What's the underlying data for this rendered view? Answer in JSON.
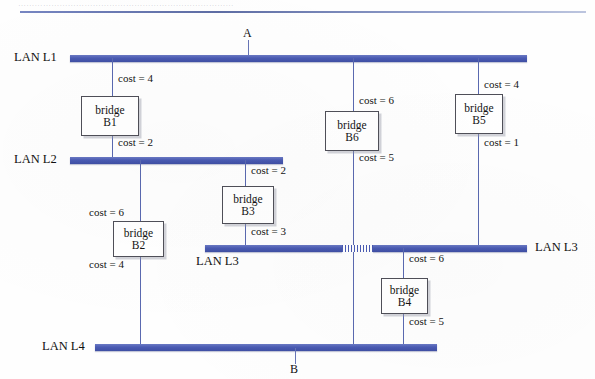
{
  "page": {
    "header_rule_present": true,
    "header_ghost_text": "……………………………………………………………………",
    "bar_color": "#4a5bb3",
    "line_color": "#5a69b0",
    "box_border_color": "#4f4f58",
    "background": "#ffffff"
  },
  "endpoints": [
    {
      "label": "A",
      "position": "top"
    },
    {
      "label": "B",
      "position": "bottom"
    }
  ],
  "lans": [
    {
      "id": "L1",
      "label": "LAN L1",
      "label_side": "left"
    },
    {
      "id": "L2",
      "label": "LAN L2",
      "label_side": "left"
    },
    {
      "id": "L3a",
      "label": "LAN L3",
      "label_side": "below-left"
    },
    {
      "id": "L3b",
      "label": "LAN L3",
      "label_side": "right"
    },
    {
      "id": "L4",
      "label": "LAN L4",
      "label_side": "left"
    }
  ],
  "bridges": [
    {
      "id": "B1",
      "word": "bridge",
      "name": "B1",
      "cost_top": "cost = 4",
      "cost_bottom": "cost = 2",
      "connects": [
        "L1",
        "L2"
      ]
    },
    {
      "id": "B2",
      "word": "bridge",
      "name": "B2",
      "cost_top": "cost = 6",
      "cost_bottom": "cost = 4",
      "connects": [
        "L2",
        "L4"
      ]
    },
    {
      "id": "B3",
      "word": "bridge",
      "name": "B3",
      "cost_top": "cost = 2",
      "cost_bottom": "cost = 3",
      "connects": [
        "L2",
        "L3"
      ]
    },
    {
      "id": "B4",
      "word": "bridge",
      "name": "B4",
      "cost_top": "cost = 6",
      "cost_bottom": "cost = 5",
      "connects": [
        "L3",
        "L4"
      ]
    },
    {
      "id": "B5",
      "word": "bridge",
      "name": "B5",
      "cost_top": "cost = 4",
      "cost_bottom": "cost = 1",
      "connects": [
        "L1",
        "L3"
      ]
    },
    {
      "id": "B6",
      "word": "bridge",
      "name": "B6",
      "cost_top": "cost = 6",
      "cost_bottom": "cost = 5",
      "connects": [
        "L1",
        "L3"
      ]
    }
  ]
}
